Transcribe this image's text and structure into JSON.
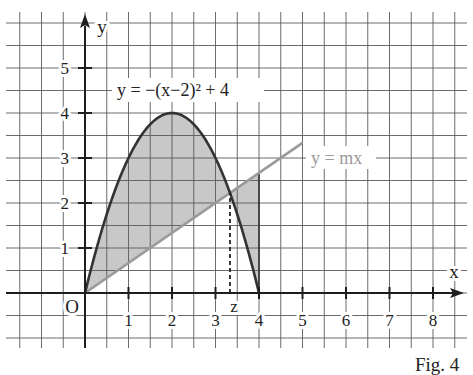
{
  "figure": {
    "caption": "Fig. 4"
  },
  "chart_data": {
    "type": "line",
    "title": "",
    "xlabel": "x",
    "ylabel": "y",
    "origin_label": "O",
    "xlim": [
      -1.5,
      8.5
    ],
    "ylim": [
      -1,
      6
    ],
    "xticks": [
      1,
      2,
      3,
      4,
      5,
      6,
      7,
      8
    ],
    "yticks": [
      1,
      2,
      3,
      4,
      5
    ],
    "grid": true,
    "grid_step": 0.5,
    "legend": "none",
    "series": [
      {
        "name": "parabola",
        "label": "y = −(x−2)² + 4",
        "form": "vertex",
        "a": -1,
        "h": 2,
        "k": 4,
        "domain": [
          0,
          4
        ],
        "points": [
          [
            0,
            0
          ],
          [
            1,
            3
          ],
          [
            2,
            4
          ],
          [
            3,
            3
          ],
          [
            4,
            0
          ]
        ],
        "color": "#333333"
      },
      {
        "name": "line",
        "label": "y = mx",
        "slope": 0.667,
        "domain": [
          0,
          5
        ],
        "points": [
          [
            0,
            0
          ],
          [
            5,
            3.33
          ]
        ],
        "color": "#9a9a9a"
      }
    ],
    "shaded_region": {
      "between": [
        "parabola",
        "line"
      ],
      "x_range": [
        0,
        4
      ],
      "color": "#c8c8c8"
    },
    "marker": {
      "label": "z",
      "x": 3.333,
      "y": 2.222,
      "style": "dashed"
    },
    "colors": {
      "grid": "#5a5a5a",
      "axes": "#1e1e1e",
      "background": "#ffffff"
    }
  }
}
